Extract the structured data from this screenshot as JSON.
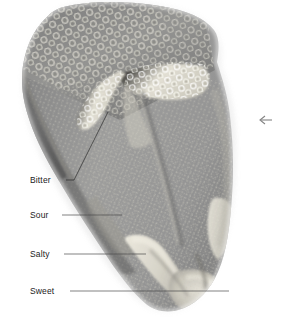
{
  "figure": {
    "background_color": "#ffffff",
    "tongue": {
      "base_color": "#8e8e8e",
      "mid_color": "#a2a2a2",
      "highlight_color": "#d9d7cf",
      "shadow_color": "#5f5f5f",
      "papillae_color": "#b9b7ae"
    }
  },
  "labels": [
    {
      "id": "bitter",
      "text": "Bitter",
      "text_x": 30,
      "text_y": 183,
      "leader_type": "diagonal",
      "leader_points": "66,180 74,180 108,112",
      "zone_color": "#e2e0d6"
    },
    {
      "id": "sour",
      "text": "Sour",
      "text_x": 30,
      "text_y": 218,
      "leader_type": "horizontal",
      "leader_points": "62,215 122,215",
      "zone_color": "#9b9a92"
    },
    {
      "id": "salty",
      "text": "Salty",
      "text_x": 30,
      "text_y": 257,
      "leader_type": "horizontal",
      "leader_points": "64,254 146,254",
      "zone_color": "#dedbd0"
    },
    {
      "id": "sweet",
      "text": "Sweet",
      "text_x": 30,
      "text_y": 294,
      "leader_type": "horizontal",
      "leader_points": "70,291 229,291",
      "zone_color": "#d8d5c9"
    }
  ],
  "markers": [
    {
      "id": "right-arrow-marker",
      "glyph": "left-arrow",
      "x": 266,
      "y": 120,
      "color": "#6d6d6d"
    }
  ],
  "colors": {
    "text": "#1b1b1b",
    "leader": "#2a2a2a",
    "marker": "#6d6d6d",
    "page_background": "#ffffff"
  }
}
